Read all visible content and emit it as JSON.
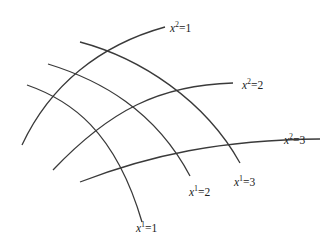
{
  "figure": {
    "coordinate_lines": [
      {
        "family": "x1",
        "label_var": "x",
        "label_index": "1",
        "label_value": "1",
        "text": "x¹=1"
      },
      {
        "family": "x1",
        "label_var": "x",
        "label_index": "1",
        "label_value": "2",
        "text": "x¹=2"
      },
      {
        "family": "x1",
        "label_var": "x",
        "label_index": "1",
        "label_value": "3",
        "text": "x¹=3"
      },
      {
        "family": "x2",
        "label_var": "x",
        "label_index": "2",
        "label_value": "1",
        "text": "x²=1"
      },
      {
        "family": "x2",
        "label_var": "x",
        "label_index": "2",
        "label_value": "2",
        "text": "x²=2"
      },
      {
        "family": "x2",
        "label_var": "x",
        "label_index": "2",
        "label_value": "3",
        "text": "x²=3"
      }
    ],
    "line_color": "#3a3a3a",
    "background": "#ffffff"
  }
}
